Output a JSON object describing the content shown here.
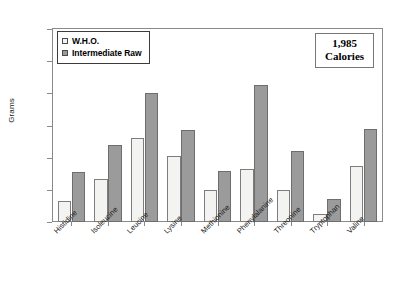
{
  "chart_data": {
    "type": "bar",
    "title": "",
    "xlabel": "",
    "ylabel": "Grams",
    "ylim": [
      0,
      6
    ],
    "yticks": [
      0,
      1,
      2,
      3,
      4,
      5,
      6
    ],
    "grid": false,
    "legend_position": "top-left",
    "categories": [
      "Histidine",
      "Isoleucine",
      "Leucine",
      "Lysine",
      "Methionine",
      "Phenylalanine",
      "Threonine",
      "Tryptophan",
      "Valine"
    ],
    "series": [
      {
        "name": "W.H.O.",
        "color": "#f3f3f1",
        "values": [
          0.65,
          1.35,
          2.6,
          2.05,
          1.0,
          1.65,
          1.0,
          0.25,
          1.75
        ]
      },
      {
        "name": "Intermediate Raw",
        "color": "#9b9b9b",
        "values": [
          1.55,
          2.4,
          4.0,
          2.85,
          1.6,
          4.25,
          2.2,
          0.7,
          2.9
        ]
      }
    ],
    "annotations": [
      {
        "name": "calories-callout",
        "value": "1,985",
        "unit": "Calories"
      }
    ]
  },
  "legend": {
    "items": [
      {
        "label": "W.H.O."
      },
      {
        "label": "Intermediate Raw"
      }
    ]
  },
  "callout": {
    "value": "1,985",
    "unit": "Calories"
  },
  "axes": {
    "y_title": "Grams"
  }
}
